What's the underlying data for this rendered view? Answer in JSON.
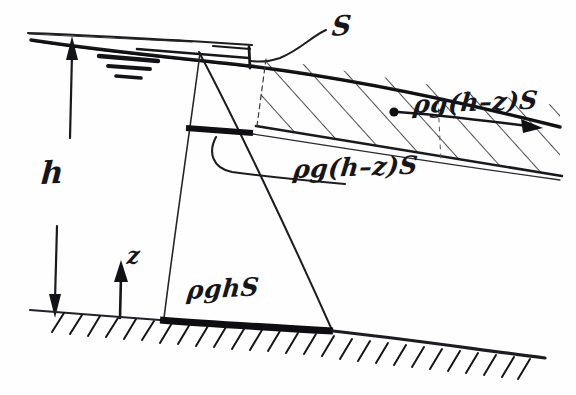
{
  "figure": {
    "ink_color": "#16161a",
    "background_color": "#fefefe",
    "width": 576,
    "height": 395
  },
  "labels": {
    "depth": "h",
    "vertical_axis": "z",
    "area_top": "S",
    "force_band": "ρg(h–z)S",
    "force_mid": "ρg(h–z)S",
    "force_bottom": "ρghS"
  },
  "annotations": {
    "free_surface_symbol": "water-surface-triple-line",
    "ground_symbol": "hatched-ground-line",
    "force_vector_symbol": "dot-with-right-arrow"
  },
  "geometry": {
    "water_surface_line": {
      "x1": 28,
      "y1": 33,
      "x2": 250,
      "y2": 44
    },
    "upper_boundary_line": {
      "x1": 30,
      "y1": 40,
      "x2": 560,
      "y2": 128
    },
    "band_lower_line": {
      "x1": 255,
      "y1": 125,
      "x2": 560,
      "y2": 175
    },
    "ground_line": {
      "x1": 30,
      "y1": 310,
      "x2": 545,
      "y2": 360
    },
    "triangle": {
      "apex": {
        "x": 200,
        "y": 52
      },
      "left_foot": {
        "x": 163,
        "y": 318
      },
      "right_foot": {
        "x": 332,
        "y": 330
      }
    },
    "mid_level_thick_line": {
      "x1": 186,
      "y1": 128,
      "x2": 252,
      "y2": 132
    },
    "force_arrow": {
      "dot_x": 395,
      "dot_y": 112,
      "tip_x": 542,
      "tip_y": 128
    }
  }
}
